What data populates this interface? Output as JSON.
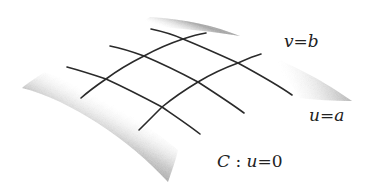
{
  "diagram": {
    "surface": {
      "corners": {
        "top": [
          150,
          17
        ],
        "right": [
          352,
          101
        ],
        "bottom": [
          168,
          182
        ],
        "left": [
          22,
          88
        ]
      },
      "shade_color": "#9a9a9a",
      "fill_color": "#ffffff"
    },
    "curves": {
      "u_family": [
        {
          "id": "u-curve-1",
          "points": [
            [
              151,
              29
            ],
            [
              183,
              39
            ],
            [
              238,
              63
            ],
            [
              292,
              95
            ]
          ]
        },
        {
          "id": "u-curve-2",
          "points": [
            [
              110,
              46
            ],
            [
              144,
              56
            ],
            [
              198,
              82
            ],
            [
              244,
              113
            ]
          ]
        },
        {
          "id": "u-curve-3",
          "points": [
            [
              67,
              67
            ],
            [
              106,
              79
            ],
            [
              162,
              107
            ],
            [
              200,
              134
            ]
          ]
        }
      ],
      "v_family": [
        {
          "id": "v-curve-1",
          "points": [
            [
              81,
              98
            ],
            [
              106,
              79
            ],
            [
              144,
              56
            ],
            [
              183,
              39
            ],
            [
              206,
              33
            ]
          ]
        },
        {
          "id": "v-curve-2",
          "points": [
            [
              139,
              130
            ],
            [
              162,
              107
            ],
            [
              198,
              82
            ],
            [
              238,
              63
            ],
            [
              261,
              54
            ]
          ]
        }
      ],
      "line_color": "#2a2a2a"
    },
    "labels": {
      "v_b": {
        "var": "v",
        "eq": "=",
        "val": "b"
      },
      "u_a": {
        "var": "u",
        "eq": "=",
        "val": "a"
      },
      "c_u0": {
        "curve": "C",
        "colon": " : ",
        "var": "u",
        "eq": "=",
        "val": "0"
      }
    }
  }
}
